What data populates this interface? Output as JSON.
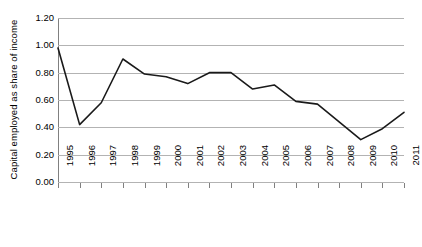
{
  "chart_data": {
    "type": "line",
    "title": "",
    "xlabel": "",
    "ylabel": "Capital employed as share of income",
    "categories": [
      "1995",
      "1996",
      "1997",
      "1998",
      "1999",
      "2000",
      "2001",
      "2002",
      "2003",
      "2004",
      "2005",
      "2006",
      "2007",
      "2008",
      "2009",
      "2010",
      "2011"
    ],
    "values": [
      0.98,
      0.42,
      0.58,
      0.9,
      0.79,
      0.77,
      0.72,
      0.8,
      0.8,
      0.68,
      0.71,
      0.59,
      0.57,
      0.44,
      0.31,
      0.39,
      0.51
    ],
    "series": [
      {
        "name": "Capital employed as share of income",
        "values": [
          0.98,
          0.42,
          0.58,
          0.9,
          0.79,
          0.77,
          0.72,
          0.8,
          0.8,
          0.68,
          0.71,
          0.59,
          0.57,
          0.44,
          0.31,
          0.39,
          0.51
        ]
      }
    ],
    "ylim": [
      0.0,
      1.2
    ],
    "y_ticks": [
      "0.00",
      "0.20",
      "0.40",
      "0.60",
      "0.80",
      "1.00",
      "1.20"
    ],
    "y_tick_values": [
      0.0,
      0.2,
      0.4,
      0.6,
      0.8,
      1.0,
      1.2
    ],
    "grid": true,
    "grid_axis": "y",
    "legend": false,
    "legend_position": "none",
    "line_color": "#1a1a1a",
    "grid_color": "#b3b3b3",
    "axis_color": "#808080",
    "background_color": "#ffffff",
    "markers": false,
    "x_tick_label_rotation": -90
  }
}
